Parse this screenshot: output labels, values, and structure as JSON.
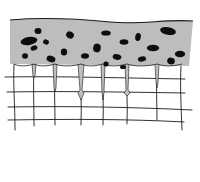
{
  "diagram": {
    "colors": {
      "background": "#ffffff",
      "layer_fill": "#bdbdbd",
      "ink": "#1a1a1a",
      "blob": "#0d0d0d"
    },
    "layer": {
      "outline": "M10,20 C45,17 80,19 110,22 C140,25 165,19 193,21 L189,66 L10,64 Z",
      "top_edge": "M10,20 C45,17 80,19 110,22 C140,25 165,19 193,21"
    },
    "blobs": [
      {
        "cx": 29,
        "cy": 41,
        "rx": 8.5,
        "ry": 4,
        "rot": -10
      },
      {
        "cx": 38,
        "cy": 31,
        "rx": 3.5,
        "ry": 3,
        "rot": 0
      },
      {
        "cx": 34,
        "cy": 48,
        "rx": 3.5,
        "ry": 2.5,
        "rot": -20
      },
      {
        "cx": 46,
        "cy": 42,
        "rx": 3,
        "ry": 2.5,
        "rot": 20
      },
      {
        "cx": 25,
        "cy": 56,
        "rx": 3,
        "ry": 2.8,
        "rot": 0
      },
      {
        "cx": 51,
        "cy": 59,
        "rx": 4.5,
        "ry": 3.2,
        "rot": 15
      },
      {
        "cx": 70,
        "cy": 35,
        "rx": 4,
        "ry": 3.4,
        "rot": 30
      },
      {
        "cx": 64,
        "cy": 52,
        "rx": 3.2,
        "ry": 3.6,
        "rot": 0
      },
      {
        "cx": 85,
        "cy": 56,
        "rx": 4,
        "ry": 2.8,
        "rot": 0
      },
      {
        "cx": 97,
        "cy": 48,
        "rx": 3.8,
        "ry": 4.4,
        "rot": 10
      },
      {
        "cx": 106,
        "cy": 33,
        "rx": 4.8,
        "ry": 2.6,
        "rot": 0
      },
      {
        "cx": 124,
        "cy": 42,
        "rx": 4.4,
        "ry": 2.8,
        "rot": 0
      },
      {
        "cx": 138,
        "cy": 37,
        "rx": 2.8,
        "ry": 4,
        "rot": 10
      },
      {
        "cx": 117,
        "cy": 57,
        "rx": 4.4,
        "ry": 2.8,
        "rot": 10
      },
      {
        "cx": 106,
        "cy": 64,
        "rx": 2.6,
        "ry": 2.6,
        "rot": 0
      },
      {
        "cx": 142,
        "cy": 59,
        "rx": 4.2,
        "ry": 2.6,
        "rot": -10
      },
      {
        "cx": 153,
        "cy": 48,
        "rx": 6.2,
        "ry": 3.2,
        "rot": 0
      },
      {
        "cx": 168,
        "cy": 31,
        "rx": 8,
        "ry": 3.8,
        "rot": 10
      },
      {
        "cx": 180,
        "cy": 54,
        "rx": 5.2,
        "ry": 3.2,
        "rot": 0
      },
      {
        "cx": 171,
        "cy": 61,
        "rx": 3.8,
        "ry": 3.4,
        "rot": 10
      },
      {
        "cx": 123,
        "cy": 67,
        "rx": 3,
        "ry": 2,
        "rot": 0
      }
    ],
    "vertical_lines": [
      "M14,64 C13,85 15,105 15,130",
      "M34,66 C33,85 34,105 34,126",
      "M55,65 C54,85 55,105 55,125",
      "M81,66 C80,85 82,105 81,125",
      "M103,65 C102,85 104,105 103,125",
      "M127,66 C126,85 128,105 127,124",
      "M157,66 C156,85 157,105 157,120",
      "M181,66 C180,85 181,105 182,130"
    ],
    "horizontal_lines": [
      "M5,77 C60,76 120,78 185,79",
      "M7,92 C60,91 120,92 185,93",
      "M8,107 C70,106 130,107 192,110",
      "M8,120 C70,119 130,119 184,122"
    ],
    "cell_walls_top": [
      "M14,64 C20,67 28,66 34,64 C40,67 48,66 55,64 C62,67 74,66 81,64 C88,67 96,66 103,64 C110,67 120,66 127,64 C135,67 150,66 157,64 C165,67 175,66 182,64"
    ],
    "plugs": [
      "M32,64 L36,64 L35,76 L34,78 L33,76 Z",
      "M53,64 L57,64 L56,88 L55,92 L54,88 Z",
      "M78,64 L84,64 L82,90 L84,93 L81,100 L78,93 L80,90 Z",
      "M101,64 L105,64 L104,92 L103,100 L102,92 Z",
      "M125,64 L129,64 L128,90 L130,93 L127,96 L124,93 L126,90 Z",
      "M155,64 L159,64 L158,82 L157,88 L156,82 Z"
    ]
  }
}
